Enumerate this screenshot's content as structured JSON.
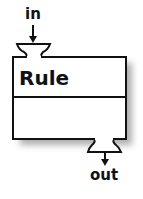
{
  "diagram": {
    "component": {
      "title": "Rule",
      "sections": 2
    },
    "ports": {
      "input": {
        "label": "in",
        "position": "top-left"
      },
      "output": {
        "label": "out",
        "position": "bottom-right"
      }
    },
    "colors": {
      "stroke": "#111111",
      "fill": "#ffffff",
      "shadow": "#9a9a9a"
    }
  }
}
